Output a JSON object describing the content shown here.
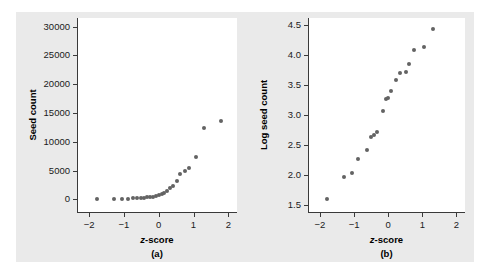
{
  "figure": {
    "background_color": "#eaeaea",
    "plot_background_color": "#ffffff",
    "marker_color": "#636363",
    "axis_color": "#3a3a3a"
  },
  "chart_data": [
    {
      "type": "scatter",
      "panel": "(a)",
      "title": "",
      "xlabel": "z-score",
      "ylabel": "Seed count",
      "xlim": [
        -2.35,
        2.25
      ],
      "ylim": [
        -2200,
        31500
      ],
      "xticks": [
        -2,
        -1,
        0,
        1,
        2
      ],
      "xtick_labels": [
        "−2",
        "−1",
        "0",
        "1",
        "2"
      ],
      "yticks": [
        0,
        5000,
        10000,
        15000,
        20000,
        25000,
        30000
      ],
      "ytick_labels": [
        "0",
        "5000",
        "10000",
        "15000",
        "20000",
        "25000",
        "30000"
      ],
      "grid": false,
      "legend": null,
      "x": [
        -1.79,
        -1.3,
        -1.06,
        -0.88,
        -0.74,
        -0.62,
        -0.52,
        -0.42,
        -0.33,
        -0.24,
        -0.16,
        -0.08,
        0.0,
        0.08,
        0.16,
        0.24,
        0.33,
        0.42,
        0.52,
        0.62,
        0.74,
        0.88,
        1.06,
        1.3,
        1.79
      ],
      "y": [
        60,
        100,
        110,
        130,
        180,
        220,
        250,
        300,
        350,
        400,
        500,
        600,
        700,
        900,
        1100,
        1500,
        1900,
        2400,
        3200,
        4400,
        5000,
        5400,
        7400,
        12400,
        13700,
        27300
      ],
      "n_points": 25
    },
    {
      "type": "scatter",
      "panel": "(b)",
      "title": "",
      "xlabel": "z-score",
      "ylabel": "Log seed count",
      "xlim": [
        -2.35,
        2.25
      ],
      "ylim": [
        1.38,
        4.62
      ],
      "xticks": [
        -2,
        -1,
        0,
        1,
        2
      ],
      "xtick_labels": [
        "−2",
        "−1",
        "0",
        "1",
        "2"
      ],
      "yticks": [
        1.5,
        2.0,
        2.5,
        3.0,
        3.5,
        4.0,
        4.5
      ],
      "ytick_labels": [
        "1.5",
        "2.0",
        "2.5",
        "3.0",
        "3.5",
        "4.0",
        "4.5"
      ],
      "grid": false,
      "legend": null,
      "x": [
        -1.79,
        -1.3,
        -1.06,
        -0.88,
        -0.62,
        -0.52,
        -0.42,
        -0.33,
        -0.16,
        -0.08,
        0.0,
        0.08,
        0.24,
        0.33,
        0.52,
        0.62,
        0.74,
        1.06,
        1.3,
        1.79
      ],
      "y": [
        1.6,
        1.97,
        2.03,
        2.27,
        2.41,
        2.63,
        2.67,
        2.72,
        3.07,
        3.26,
        3.28,
        3.41,
        3.58,
        3.71,
        3.72,
        3.86,
        4.09,
        4.14,
        4.44
      ],
      "n_points": 20
    }
  ],
  "panel_a": {
    "ylabel": "Seed count",
    "xlabel_pre": "z",
    "xlabel_post": "-score",
    "caption": "(a)",
    "ytick_labels": [
      "30000",
      "25000",
      "20000",
      "15000",
      "10000",
      "5000",
      "0"
    ],
    "xtick_labels": [
      "−2",
      "−1",
      "0",
      "1",
      "2"
    ]
  },
  "panel_b": {
    "ylabel": "Log seed count",
    "xlabel_pre": "z",
    "xlabel_post": "-score",
    "caption": "(b)",
    "ytick_labels": [
      "4.5",
      "4.0",
      "3.5",
      "3.0",
      "2.5",
      "2.0",
      "1.5"
    ],
    "xtick_labels": [
      "−2",
      "−1",
      "0",
      "1",
      "2"
    ]
  }
}
